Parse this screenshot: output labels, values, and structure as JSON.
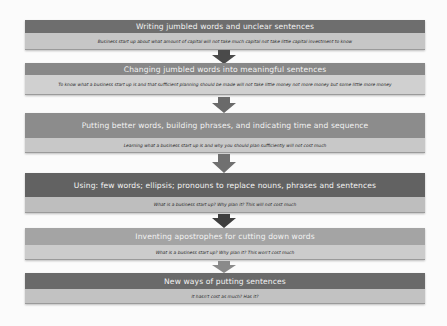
{
  "diagram": {
    "type": "vertical-flow",
    "steps": [
      {
        "title": "Writing jumbled words and unclear sentences",
        "example": "Business start up about what amount of capital will not take much capital not take little capital investment to know",
        "header_color": "#6e6e6e",
        "sub_color": "#c6c6c6"
      },
      {
        "title": "Changing jumbled words into meaningful sentences",
        "example": "To know what a business start up is and that sufficient planning should be made will not take little money not more money but some little more money",
        "header_color": "#888888",
        "sub_color": "#d0d0d0"
      },
      {
        "title": "Putting better words, building phrases, and indicating time and sequence",
        "example": "Learning what a business start up is and why you should plan sufficiently will not cost much",
        "header_color": "#8c8c8c",
        "sub_color": "#c8c8c8"
      },
      {
        "title": "Using: few words; ellipsis; pronouns to replace nouns, phrases and sentences",
        "example": "What is a business start up? Why plan it? This will not cost much",
        "header_color": "#626262",
        "sub_color": "#bebebe"
      },
      {
        "title": "Inventing apostrophes for cutting down words",
        "example": "What is a business start up? Why plan it? This won't cost much",
        "header_color": "#a4a4a4",
        "sub_color": "#cccccc"
      },
      {
        "title": "New ways of putting sentences",
        "example": "It hasn't cost as much? Has it?",
        "header_color": "#6a6a6a",
        "sub_color": "#c2c2c2"
      }
    ],
    "arrows": [
      {
        "from": 0,
        "to": 1,
        "color": "#4a4a4a"
      },
      {
        "from": 1,
        "to": 2,
        "color": "#6a6a6a"
      },
      {
        "from": 2,
        "to": 3,
        "color": "#707070"
      },
      {
        "from": 3,
        "to": 4,
        "color": "#3e3e3e"
      },
      {
        "from": 4,
        "to": 5,
        "color": "#8a8a8a"
      }
    ]
  }
}
